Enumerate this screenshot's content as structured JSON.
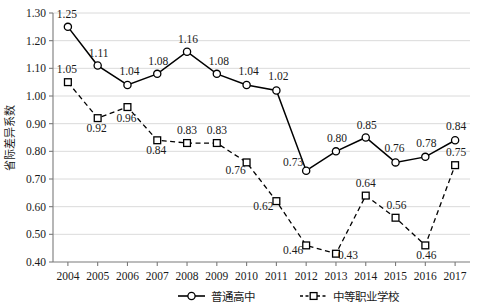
{
  "chart_data": {
    "type": "line",
    "title": "",
    "xlabel": "",
    "ylabel": "省际差异系数",
    "ylim": [
      0.4,
      1.3
    ],
    "ytick_step": 0.1,
    "grid": true,
    "legend_position": "bottom",
    "categories": [
      "2004",
      "2005",
      "2006",
      "2007",
      "2008",
      "2009",
      "2010",
      "2011",
      "2012",
      "2013",
      "2014",
      "2015",
      "2016",
      "2017"
    ],
    "yticks": [
      "0.40",
      "0.50",
      "0.60",
      "0.70",
      "0.80",
      "0.90",
      "1.00",
      "1.10",
      "1.20",
      "1.30"
    ],
    "series": [
      {
        "name": "普通高中",
        "marker": "circle",
        "line_style": "solid",
        "color": "#000000",
        "values": [
          1.25,
          1.11,
          1.04,
          1.08,
          1.16,
          1.08,
          1.04,
          1.02,
          0.73,
          0.8,
          0.85,
          0.76,
          0.78,
          0.84
        ],
        "labels": [
          "1.25",
          "1.11",
          "1.04",
          "1.08",
          "1.16",
          "1.08",
          "1.04",
          "1.02",
          "0.73",
          "0.80",
          "0.85",
          "0.76",
          "0.78",
          "0.84"
        ],
        "label_offsets": [
          {
            "dx": -1,
            "dy": -9
          },
          {
            "dx": 1,
            "dy": -9
          },
          {
            "dx": 2,
            "dy": -10
          },
          {
            "dx": 1,
            "dy": -9
          },
          {
            "dx": 1,
            "dy": -9
          },
          {
            "dx": 2,
            "dy": -9
          },
          {
            "dx": 2,
            "dy": -10
          },
          {
            "dx": 2,
            "dy": -10
          },
          {
            "dx": -13,
            "dy": -5
          },
          {
            "dx": 1,
            "dy": -9
          },
          {
            "dx": 1,
            "dy": -9
          },
          {
            "dx": -1,
            "dy": -10
          },
          {
            "dx": 1,
            "dy": -10
          },
          {
            "dx": 1,
            "dy": -10
          }
        ]
      },
      {
        "name": "中等职业学校",
        "marker": "square",
        "line_style": "dashed",
        "color": "#000000",
        "values": [
          1.05,
          0.92,
          0.96,
          0.84,
          0.83,
          0.83,
          0.76,
          0.62,
          0.46,
          0.43,
          0.64,
          0.56,
          0.46,
          0.75
        ],
        "labels": [
          "1.05",
          "0.92",
          "0.96",
          "0.84",
          "0.83",
          "0.83",
          "0.76",
          "0.62",
          "0.46",
          "0.43",
          "0.64",
          "0.56",
          "0.46",
          "0.75"
        ],
        "label_offsets": [
          {
            "dx": -1,
            "dy": -9
          },
          {
            "dx": -1,
            "dy": 14
          },
          {
            "dx": -1,
            "dy": 15
          },
          {
            "dx": -1,
            "dy": 14
          },
          {
            "dx": 0,
            "dy": -9
          },
          {
            "dx": 0,
            "dy": -9
          },
          {
            "dx": -11,
            "dy": 12
          },
          {
            "dx": -13,
            "dy": 9
          },
          {
            "dx": -13,
            "dy": 9
          },
          {
            "dx": 12,
            "dy": 5
          },
          {
            "dx": 0,
            "dy": -9
          },
          {
            "dx": 1,
            "dy": -9
          },
          {
            "dx": 1,
            "dy": 14
          },
          {
            "dx": 1,
            "dy": -9
          }
        ]
      }
    ]
  },
  "legend": {
    "items": [
      {
        "label": "普通高中",
        "marker": "circle",
        "line_style": "solid"
      },
      {
        "label": "中等职业学校",
        "marker": "square",
        "line_style": "dashed"
      }
    ]
  }
}
